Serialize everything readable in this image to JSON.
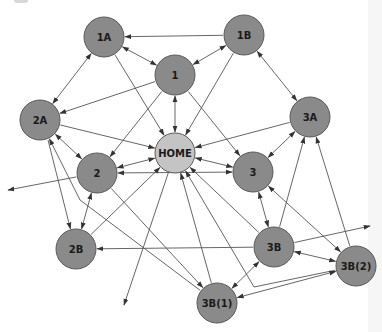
{
  "diagram": {
    "title": "",
    "colors": {
      "node_fill": "#8a8a8a",
      "home_fill": "#c4c4c4",
      "edge": "#555555",
      "label": "#1a1a1a"
    },
    "nodes": [
      {
        "id": "1A",
        "label": "1A",
        "x": 104,
        "y": 37,
        "r": 20,
        "type": "page"
      },
      {
        "id": "1B",
        "label": "1B",
        "x": 244,
        "y": 35,
        "r": 20,
        "type": "page"
      },
      {
        "id": "1",
        "label": "1",
        "x": 175,
        "y": 75,
        "r": 20,
        "type": "page"
      },
      {
        "id": "2A",
        "label": "2A",
        "x": 40,
        "y": 120,
        "r": 20,
        "type": "page"
      },
      {
        "id": "3A",
        "label": "3A",
        "x": 310,
        "y": 117,
        "r": 20,
        "type": "page"
      },
      {
        "id": "HOME",
        "label": "HOME",
        "x": 175,
        "y": 153,
        "r": 20,
        "type": "home"
      },
      {
        "id": "2",
        "label": "2",
        "x": 97,
        "y": 173,
        "r": 20,
        "type": "page"
      },
      {
        "id": "3",
        "label": "3",
        "x": 253,
        "y": 172,
        "r": 20,
        "type": "page"
      },
      {
        "id": "2B",
        "label": "2B",
        "x": 76,
        "y": 249,
        "r": 20,
        "type": "page"
      },
      {
        "id": "3B",
        "label": "3B",
        "x": 274,
        "y": 247,
        "r": 20,
        "type": "page"
      },
      {
        "id": "3B(2)",
        "label": "3B(2)",
        "x": 356,
        "y": 266,
        "r": 20,
        "type": "page"
      },
      {
        "id": "3B(1)",
        "label": "3B(1)",
        "x": 217,
        "y": 303,
        "r": 20,
        "type": "page"
      }
    ],
    "edges": [
      {
        "from": "1B",
        "to": "1A",
        "dir": "forward"
      },
      {
        "from": "1A",
        "to": "1",
        "dir": "both"
      },
      {
        "from": "1A",
        "to": "2A",
        "dir": "both"
      },
      {
        "from": "1A",
        "to": "HOME",
        "dir": "forward"
      },
      {
        "from": "1B",
        "to": "1",
        "dir": "both"
      },
      {
        "from": "1B",
        "to": "3A",
        "dir": "both"
      },
      {
        "from": "1B",
        "to": "HOME",
        "dir": "forward"
      },
      {
        "from": "1",
        "to": "HOME",
        "dir": "both"
      },
      {
        "from": "1",
        "to": "2A",
        "dir": "forward"
      },
      {
        "from": "1",
        "to": "2",
        "dir": "forward"
      },
      {
        "from": "1",
        "to": "3",
        "dir": "forward"
      },
      {
        "from": "2A",
        "to": "HOME",
        "dir": "forward"
      },
      {
        "from": "2A",
        "to": "2",
        "dir": "both"
      },
      {
        "from": "3A",
        "to": "HOME",
        "dir": "forward"
      },
      {
        "from": "3A",
        "to": "3",
        "dir": "both"
      },
      {
        "from": "HOME",
        "to": "2",
        "dir": "both"
      },
      {
        "from": "HOME",
        "to": "3",
        "dir": "both"
      },
      {
        "from": "3",
        "to": "2",
        "dir": "both"
      },
      {
        "from": "2",
        "to": "off-left",
        "dir": "forward",
        "end": [
          8,
          190
        ]
      },
      {
        "from": "2B",
        "to": "2",
        "dir": "both"
      },
      {
        "from": "2B",
        "to": "HOME",
        "dir": "forward"
      },
      {
        "from": "3B",
        "to": "2B",
        "dir": "forward"
      },
      {
        "from": "2A",
        "to": "2B",
        "dir": "forward",
        "start": [
          48,
          140
        ]
      },
      {
        "from": "3B(1)",
        "to": "2A",
        "dir": "forward",
        "via": [
          [
            80,
            200
          ]
        ]
      },
      {
        "from": "2",
        "to": "3B(1)",
        "dir": "forward"
      },
      {
        "from": "HOME",
        "to": "off-bottom",
        "dir": "forward",
        "end": [
          124,
          305
        ]
      },
      {
        "from": "3B(1)",
        "to": "HOME",
        "dir": "forward"
      },
      {
        "from": "3B",
        "to": "HOME",
        "dir": "forward"
      },
      {
        "from": "3B(2)",
        "to": "HOME",
        "dir": "forward",
        "via": [
          [
            254,
            287
          ]
        ]
      },
      {
        "from": "3B",
        "to": "3",
        "dir": "both"
      },
      {
        "from": "3B(2)",
        "to": "3",
        "dir": "both"
      },
      {
        "from": "3B",
        "to": "3A",
        "dir": "forward"
      },
      {
        "from": "3B(2)",
        "to": "3A",
        "dir": "forward"
      },
      {
        "from": "3B",
        "to": "3B(2)",
        "dir": "both"
      },
      {
        "from": "3B",
        "to": "3B(1)",
        "dir": "both"
      },
      {
        "from": "3B(1)",
        "to": "3B(2)",
        "dir": "both"
      },
      {
        "from": "3B",
        "to": "off-right",
        "dir": "forward",
        "end": [
          370,
          226
        ]
      }
    ]
  }
}
